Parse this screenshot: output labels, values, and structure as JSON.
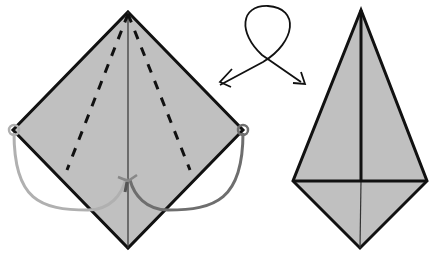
{
  "diagram": {
    "type": "origami-fold-step",
    "colors": {
      "paper": "#c0c0c0",
      "outline": "#111111",
      "left_arrow": "#b0b0b0",
      "right_arrow": "#6e6e6e",
      "background": "#ffffff"
    },
    "before": {
      "shape": "diamond",
      "center_crease": "vertical valley line",
      "dashed_fold_lines": 2,
      "fold_arrows": [
        "left-corner-to-center",
        "right-corner-to-center"
      ]
    },
    "transition": {
      "symbol": "turn-over loop arrow"
    },
    "after": {
      "shape": "kite",
      "lines": [
        "center vertical",
        "horizontal base"
      ]
    }
  }
}
